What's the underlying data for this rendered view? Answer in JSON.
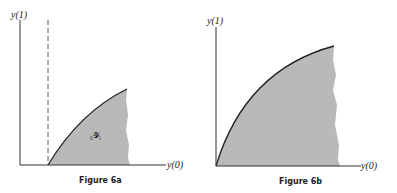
{
  "figures": [
    {
      "caption": "Figure 6a",
      "y_axis_label": "y(1)",
      "x_axis_label": "y(0)",
      "region_label": "₀𝒴₁",
      "fill_color": "#b8b8b8",
      "has_dashed_line": true
    },
    {
      "caption": "Figure 6b",
      "y_axis_label": "y(1)",
      "x_axis_label": "y(0)",
      "fill_color": "#b8b8b8",
      "has_dashed_line": false
    }
  ]
}
